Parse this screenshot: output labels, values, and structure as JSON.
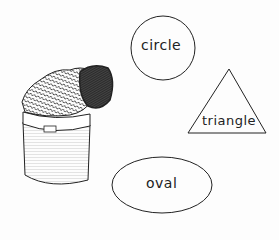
{
  "shapes": {
    "circle": {
      "label": "circle"
    },
    "triangle": {
      "label": "triangle"
    },
    "oval": {
      "label": "oval"
    }
  },
  "illustration": {
    "subject": "can-with-lid"
  }
}
